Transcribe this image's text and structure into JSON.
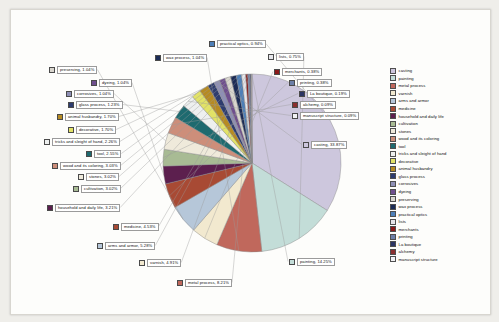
{
  "chart_data": {
    "type": "pie",
    "title": "",
    "legend_position": "right",
    "value_suffix": "%",
    "categories": [
      "casting",
      "painting",
      "metal process",
      "varnish",
      "arms and armor",
      "medicine",
      "household and daily life",
      "cultivation",
      "stones",
      "wood and its coloring",
      "tool",
      "tricks and sleight of hand",
      "decorative",
      "animal husbandry",
      "glass process",
      "corrosives",
      "dyeing",
      "preserving",
      "wax process",
      "practical optics",
      "lists",
      "merchants",
      "printing",
      "La boutique",
      "alchemy",
      "manuscript structure"
    ],
    "values": [
      33.87,
      14.25,
      8.21,
      5.28,
      4.53,
      3.21,
      3.02,
      3.02,
      3.03,
      2.55,
      2.26,
      1.7,
      1.7,
      1.23,
      1.04,
      1.04,
      1.04,
      1.04,
      0.94,
      4.91,
      0.75,
      0.38,
      0.38,
      0.19,
      0.09,
      0.09
    ],
    "slices": [
      {
        "label": "casting",
        "value": 33.87,
        "display": "casting, 33.87%",
        "color": "#cdc7dd"
      },
      {
        "label": "painting",
        "value": 14.25,
        "display": "painting, 14.25%",
        "color": "#c3ddd8"
      },
      {
        "label": "metal process",
        "value": 8.21,
        "display": "metal process, 8.21%",
        "color": "#c0685c"
      },
      {
        "label": "varnish",
        "value": 4.91,
        "display": "varnish, 4.91%",
        "color": "#f2e9cf"
      },
      {
        "label": "arms and armor",
        "value": 5.28,
        "display": "arms and armor, 5.28%",
        "color": "#b6c7d9"
      },
      {
        "label": "medicine",
        "value": 4.53,
        "display": "medicine, 4.53%",
        "color": "#a84a34"
      },
      {
        "label": "household and daily life",
        "value": 3.21,
        "display": "household and daily life, 3.21%",
        "color": "#5c1f4e"
      },
      {
        "label": "cultivation",
        "value": 3.02,
        "display": "cultivation, 3.02%",
        "color": "#a8bb94"
      },
      {
        "label": "stones",
        "value": 3.02,
        "display": "stones, 3.02%",
        "color": "#efeadb"
      },
      {
        "label": "wood and its coloring",
        "value": 3.03,
        "display": "wood and its coloring, 3.03%",
        "color": "#cd8e7a"
      },
      {
        "label": "tool",
        "value": 2.55,
        "display": "tool, 2.55%",
        "color": "#1e6a6f"
      },
      {
        "label": "tricks and sleight of hand",
        "value": 2.26,
        "display": "tricks and sleight of hand, 2.26%",
        "color": "#eef0ef"
      },
      {
        "label": "decorative",
        "value": 1.7,
        "display": "decorative, 1.70%",
        "color": "#e2e267"
      },
      {
        "label": "animal husbandry",
        "value": 1.7,
        "display": "animal husbandry, 1.70%",
        "color": "#b68b22"
      },
      {
        "label": "glass process",
        "value": 1.23,
        "display": "glass process, 1.23%",
        "color": "#2e3c6e"
      },
      {
        "label": "corrosives",
        "value": 1.04,
        "display": "corrosives, 1.04%",
        "color": "#8e8fb5"
      },
      {
        "label": "dyeing",
        "value": 1.04,
        "display": "dyeing, 1.04%",
        "color": "#6f4f8e"
      },
      {
        "label": "preserving",
        "value": 1.04,
        "display": "preserving, 1.04%",
        "color": "#d9d6ce"
      },
      {
        "label": "wax process",
        "value": 1.04,
        "display": "wax process, 1.04%",
        "color": "#1b2b55"
      },
      {
        "label": "practical optics",
        "value": 0.94,
        "display": "practical optics, 0.94%",
        "color": "#4d7fb8"
      },
      {
        "label": "lists",
        "value": 0.75,
        "display": "lists, 0.75%",
        "color": "#e6e6ea"
      },
      {
        "label": "merchants",
        "value": 0.38,
        "display": "merchants, 0.38%",
        "color": "#8b1a1a"
      },
      {
        "label": "printing",
        "value": 0.38,
        "display": "printing, 0.38%",
        "color": "#6c7fa8"
      },
      {
        "label": "La boutique",
        "value": 0.19,
        "display": "La boutique, 0.19%",
        "color": "#2b3564"
      },
      {
        "label": "alchemy",
        "value": 0.09,
        "display": "alchemy, 0.09%",
        "color": "#8b2f2f"
      },
      {
        "label": "manuscript structure",
        "value": 0.09,
        "display": "manuscript structure, 0.09%",
        "color": "#f2f2f4"
      }
    ]
  },
  "legend": {
    "items": [
      {
        "label": "casting",
        "color": "#cdc7dd"
      },
      {
        "label": "painting",
        "color": "#c3ddd8"
      },
      {
        "label": "metal process",
        "color": "#c0685c"
      },
      {
        "label": "varnish",
        "color": "#f2e9cf"
      },
      {
        "label": "arms and armor",
        "color": "#b6c7d9"
      },
      {
        "label": "medicine",
        "color": "#a84a34"
      },
      {
        "label": "household and daily life",
        "color": "#5c1f4e"
      },
      {
        "label": "cultivation",
        "color": "#a8bb94"
      },
      {
        "label": "stones",
        "color": "#efeadb"
      },
      {
        "label": "wood and its coloring",
        "color": "#cd8e7a"
      },
      {
        "label": "tool",
        "color": "#1e6a6f"
      },
      {
        "label": "tricks and sleight of hand",
        "color": "#eef0ef"
      },
      {
        "label": "decorative",
        "color": "#e2e267"
      },
      {
        "label": "animal husbandry",
        "color": "#b68b22"
      },
      {
        "label": "glass process",
        "color": "#2e3c6e"
      },
      {
        "label": "corrosives",
        "color": "#8e8fb5"
      },
      {
        "label": "dyeing",
        "color": "#6f4f8e"
      },
      {
        "label": "preserving",
        "color": "#d9d6ce"
      },
      {
        "label": "wax process",
        "color": "#1b2b55"
      },
      {
        "label": "practical optics",
        "color": "#4d7fb8"
      },
      {
        "label": "lists",
        "color": "#e6e6ea"
      },
      {
        "label": "merchants",
        "color": "#8b1a1a"
      },
      {
        "label": "printing",
        "color": "#6c7fa8"
      },
      {
        "label": "La boutique",
        "color": "#2b3564"
      },
      {
        "label": "alchemy",
        "color": "#8b2f2f"
      },
      {
        "label": "manuscript structure",
        "color": "#f2f2f4"
      }
    ]
  },
  "callouts": [
    {
      "key": "practical optics",
      "text": "practical optics, 0.94%",
      "color": "#4d7fb8",
      "x": 198,
      "y": 30,
      "anchor": 0
    },
    {
      "key": "lists",
      "text": "lists, 0.75%",
      "color": "#e6e6ea",
      "x": 257,
      "y": 43,
      "anchor": 1
    },
    {
      "key": "wax process",
      "text": "wax process, 1.04%",
      "color": "#1b2b55",
      "x": 144,
      "y": 44,
      "anchor": 2
    },
    {
      "key": "merchants",
      "text": "merchants, 0.38%",
      "color": "#8b1a1a",
      "x": 263,
      "y": 58,
      "anchor": 3
    },
    {
      "key": "preserving",
      "text": "preserving, 1.04%",
      "color": "#d9d6ce",
      "x": 38,
      "y": 56,
      "anchor": 4
    },
    {
      "key": "printing",
      "text": "printing, 0.38%",
      "color": "#6c7fa8",
      "x": 278,
      "y": 69,
      "anchor": 5
    },
    {
      "key": "dyeing",
      "text": "dyeing, 1.04%",
      "color": "#6f4f8e",
      "x": 80,
      "y": 69,
      "anchor": 6
    },
    {
      "key": "La boutique",
      "text": "La boutique, 0.19%",
      "color": "#2b3564",
      "x": 288,
      "y": 80,
      "anchor": 7
    },
    {
      "key": "corrosives",
      "text": "corrosives, 1.04%",
      "color": "#8e8fb5",
      "x": 55,
      "y": 80,
      "anchor": 8
    },
    {
      "key": "alchemy",
      "text": "alchemy, 0.09%",
      "color": "#8b2f2f",
      "x": 281,
      "y": 91,
      "anchor": 9
    },
    {
      "key": "glass process",
      "text": "glass process, 1.23%",
      "color": "#2e3c6e",
      "x": 57,
      "y": 91,
      "anchor": 10
    },
    {
      "key": "manuscript structure",
      "text": "manuscript structure, 0.09%",
      "color": "#f2f2f4",
      "x": 281,
      "y": 102,
      "anchor": 11
    },
    {
      "key": "animal husbandry",
      "text": "animal husbandry, 1.70%",
      "color": "#b68b22",
      "x": 46,
      "y": 103,
      "anchor": 12
    },
    {
      "key": "decorative",
      "text": "decorative, 1.70%",
      "color": "#e2e267",
      "x": 57,
      "y": 116,
      "anchor": 13
    },
    {
      "key": "tricks and sleight of hand",
      "text": "tricks and sleight of hand, 2.26%",
      "color": "#eef0ef",
      "x": 33,
      "y": 128,
      "anchor": 14
    },
    {
      "key": "casting",
      "text": "casting, 33.87%",
      "color": "#cdc7dd",
      "x": 292,
      "y": 131,
      "anchor": 15
    },
    {
      "key": "tool",
      "text": "tool, 2.55%",
      "color": "#1e6a6f",
      "x": 75,
      "y": 140,
      "anchor": 16
    },
    {
      "key": "wood and its coloring",
      "text": "wood and its coloring, 3.03%",
      "color": "#cd8e7a",
      "x": 41,
      "y": 152,
      "anchor": 17
    },
    {
      "key": "stones",
      "text": "stones, 3.02%",
      "color": "#efeadb",
      "x": 67,
      "y": 163,
      "anchor": 18
    },
    {
      "key": "cultivation",
      "text": "cultivation, 3.02%",
      "color": "#a8bb94",
      "x": 62,
      "y": 175,
      "anchor": 19
    },
    {
      "key": "household and daily life",
      "text": "household and daily life, 3.21%",
      "color": "#5c1f4e",
      "x": 36,
      "y": 194,
      "anchor": 20
    },
    {
      "key": "medicine",
      "text": "medicine, 4.53%",
      "color": "#a84a34",
      "x": 102,
      "y": 213,
      "anchor": 21
    },
    {
      "key": "arms and armor",
      "text": "arms and armor, 5.28%",
      "color": "#b6c7d9",
      "x": 86,
      "y": 232,
      "anchor": 22
    },
    {
      "key": "varnish",
      "text": "varnish, 4.91%",
      "color": "#f2e9cf",
      "x": 128,
      "y": 249,
      "anchor": 23
    },
    {
      "key": "metal process",
      "text": "metal process, 8.21%",
      "color": "#c0685c",
      "x": 166,
      "y": 269,
      "anchor": 24
    },
    {
      "key": "painting",
      "text": "painting, 14.25%",
      "color": "#c3ddd8",
      "x": 278,
      "y": 248,
      "anchor": 25
    }
  ]
}
